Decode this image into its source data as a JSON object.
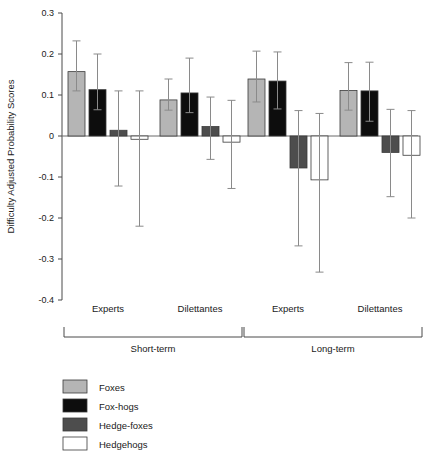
{
  "chart_data": {
    "type": "bar",
    "title": "",
    "subtitle": "",
    "xlabel": "",
    "ylabel": "Difficulty Adjusted Probability Scores",
    "ylim": [
      -0.4,
      0.3
    ],
    "ytick_labels": [
      "0.3",
      "0.2",
      "0.1",
      "0",
      "-0.1",
      "-0.2",
      "-0.3",
      "-0.4"
    ],
    "ytick_values": [
      0.3,
      0.2,
      0.1,
      0,
      -0.1,
      -0.2,
      -0.3,
      -0.4
    ],
    "grid": false,
    "orientation": "vertical",
    "error_bars": "95% confidence interval",
    "legend_position": "bottom-left",
    "categories": [
      "Experts",
      "Dilettantes",
      "Experts",
      "Dilettantes"
    ],
    "group_brackets": [
      {
        "label": "Short-term",
        "categories": [
          "Experts",
          "Dilettantes"
        ]
      },
      {
        "label": "Long-term",
        "categories": [
          "Experts",
          "Dilettantes"
        ]
      }
    ],
    "series": [
      {
        "name": "Foxes",
        "color": "#b5b5b5",
        "values": [
          0.157,
          0.088,
          0.139,
          0.111
        ],
        "err_upper": [
          0.232,
          0.139,
          0.207,
          0.179
        ],
        "err_lower": [
          0.11,
          0.063,
          0.083,
          0.063
        ]
      },
      {
        "name": "Fox-hogs",
        "color": "#0d0d0d",
        "values": [
          0.113,
          0.105,
          0.134,
          0.11
        ],
        "err_upper": [
          0.2,
          0.19,
          0.205,
          0.18
        ],
        "err_lower": [
          0.064,
          0.057,
          0.066,
          0.036
        ]
      },
      {
        "name": "Hedge-foxes",
        "color": "#4d4d4d",
        "values": [
          0.014,
          0.023,
          -0.078,
          -0.04
        ],
        "err_upper": [
          0.11,
          0.095,
          0.062,
          0.065
        ],
        "err_lower": [
          -0.122,
          -0.057,
          -0.268,
          -0.148
        ]
      },
      {
        "name": "Hedgehogs",
        "color": "#ffffff",
        "values": [
          -0.008,
          -0.015,
          -0.107,
          -0.047
        ],
        "err_upper": [
          0.11,
          0.087,
          0.055,
          0.062
        ],
        "err_lower": [
          -0.22,
          -0.128,
          -0.332,
          -0.2
        ]
      }
    ],
    "legend_entries": [
      {
        "label": "Foxes",
        "color": "#b5b5b5"
      },
      {
        "label": "Fox-hogs",
        "color": "#0d0d0d"
      },
      {
        "label": "Hedge-foxes",
        "color": "#4d4d4d"
      },
      {
        "label": "Hedgehogs",
        "color": "#ffffff"
      }
    ]
  }
}
